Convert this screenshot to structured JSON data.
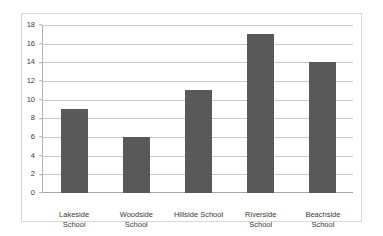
{
  "chart_data": {
    "type": "bar",
    "title": "",
    "subtitle": "",
    "xlabel": "",
    "ylabel": "",
    "categories": [
      "Lakeside School",
      "Woodside School",
      "Hillside School",
      "Riverside School",
      "Beachside School"
    ],
    "category_lines": [
      [
        "Lakeside",
        "School"
      ],
      [
        "Woodside",
        "School"
      ],
      [
        "Hillside School"
      ],
      [
        "Riverside",
        "School"
      ],
      [
        "Beachside",
        "School"
      ]
    ],
    "values": [
      9,
      6,
      11,
      17,
      14
    ],
    "ylim": [
      0,
      18
    ],
    "ytick_step": 2,
    "yticks": [
      0,
      2,
      4,
      6,
      8,
      10,
      12,
      14,
      16,
      18
    ],
    "ytick_labels": [
      "0",
      "2",
      "4",
      "6",
      "8",
      "10",
      "12",
      "14",
      "16",
      "18"
    ],
    "grid": true,
    "grid_axis": "y",
    "legend": false,
    "legend_position": "none",
    "annotations": [],
    "colors": {
      "bar_fill": "#595959",
      "gridline": "#c9c9c9",
      "axis_line": "#b0b0b0",
      "baseline": "#a6a6a6",
      "frame_border": "#d8d8d8",
      "text": "#3b3b3b",
      "background": "#ffffff"
    }
  }
}
